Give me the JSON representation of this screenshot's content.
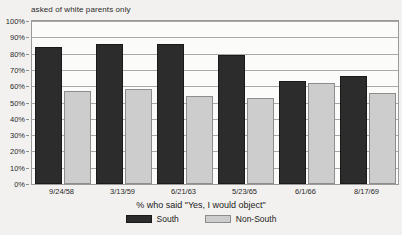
{
  "chart_data": {
    "type": "bar",
    "title": "asked of white parents only",
    "xlabel": "% who said \"Yes, I would object\"",
    "ylabel": "",
    "categories": [
      "9/24/58",
      "3/13/59",
      "6/21/63",
      "5/23/65",
      "6/1/66",
      "8/17/69"
    ],
    "series": [
      {
        "name": "South",
        "color": "#2c2c2c",
        "values": [
          84,
          86,
          86,
          79,
          63,
          66
        ]
      },
      {
        "name": "Non-South",
        "color": "#cdcdcd",
        "values": [
          57,
          58,
          54,
          53,
          62,
          56
        ]
      }
    ],
    "ylim": [
      0,
      100
    ],
    "ytick_labels": [
      "0%",
      "10%",
      "20%",
      "30%",
      "40%",
      "50%",
      "60%",
      "70%",
      "80%",
      "90%",
      "100%"
    ],
    "ytick_values": [
      0,
      10,
      20,
      30,
      40,
      50,
      60,
      70,
      80,
      90,
      100
    ],
    "grid": true,
    "legend_position": "bottom"
  }
}
